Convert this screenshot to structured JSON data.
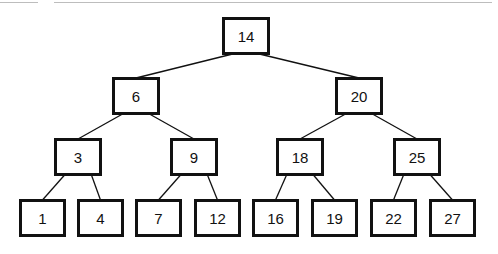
{
  "diagram": {
    "type": "binary-search-tree",
    "nodes": [
      {
        "id": "n14",
        "label": "14",
        "x": 222,
        "y": 17,
        "w": 48,
        "h": 38
      },
      {
        "id": "n6",
        "label": "6",
        "x": 112,
        "y": 77,
        "w": 48,
        "h": 38
      },
      {
        "id": "n20",
        "label": "20",
        "x": 335,
        "y": 77,
        "w": 48,
        "h": 38
      },
      {
        "id": "n3",
        "label": "3",
        "x": 54,
        "y": 138,
        "w": 48,
        "h": 38
      },
      {
        "id": "n9",
        "label": "9",
        "x": 170,
        "y": 138,
        "w": 48,
        "h": 38
      },
      {
        "id": "n18",
        "label": "18",
        "x": 276,
        "y": 138,
        "w": 48,
        "h": 38
      },
      {
        "id": "n25",
        "label": "25",
        "x": 393,
        "y": 138,
        "w": 48,
        "h": 38
      },
      {
        "id": "n1",
        "label": "1",
        "x": 19,
        "y": 199,
        "w": 47,
        "h": 38
      },
      {
        "id": "n4",
        "label": "4",
        "x": 77,
        "y": 199,
        "w": 47,
        "h": 38
      },
      {
        "id": "n7",
        "label": "7",
        "x": 135,
        "y": 199,
        "w": 47,
        "h": 38
      },
      {
        "id": "n12",
        "label": "12",
        "x": 194,
        "y": 199,
        "w": 47,
        "h": 38
      },
      {
        "id": "n16",
        "label": "16",
        "x": 252,
        "y": 199,
        "w": 47,
        "h": 38
      },
      {
        "id": "n19",
        "label": "19",
        "x": 311,
        "y": 199,
        "w": 47,
        "h": 38
      },
      {
        "id": "n22",
        "label": "22",
        "x": 370,
        "y": 199,
        "w": 47,
        "h": 38
      },
      {
        "id": "n27",
        "label": "27",
        "x": 429,
        "y": 199,
        "w": 47,
        "h": 38
      }
    ],
    "edges": [
      [
        "n14",
        "n6"
      ],
      [
        "n14",
        "n20"
      ],
      [
        "n6",
        "n3"
      ],
      [
        "n6",
        "n9"
      ],
      [
        "n20",
        "n18"
      ],
      [
        "n20",
        "n25"
      ],
      [
        "n3",
        "n1"
      ],
      [
        "n3",
        "n4"
      ],
      [
        "n9",
        "n7"
      ],
      [
        "n9",
        "n12"
      ],
      [
        "n18",
        "n16"
      ],
      [
        "n18",
        "n19"
      ],
      [
        "n25",
        "n22"
      ],
      [
        "n25",
        "n27"
      ]
    ],
    "colors": {
      "stroke": "#111111",
      "fill": "#ffffff",
      "background": "#ffffff"
    }
  }
}
